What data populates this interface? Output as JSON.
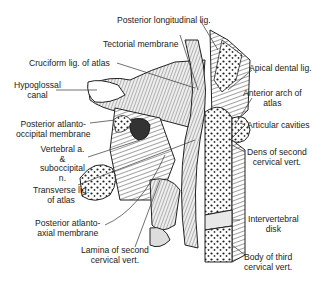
{
  "figure": {
    "labels": {
      "posterior_longitudinal_lig": "Posterior longitudinal lig.",
      "tectorial_membrane": "Tectorial membrane",
      "cruciform_lig": "Cruciform lig. of atlas",
      "hypoglossal_canal_1": "Hypoglossal",
      "hypoglossal_canal_2": "canal",
      "apical_dental_lig": "Apical dental lig.",
      "anterior_arch_1": "Anterior arch of",
      "anterior_arch_2": "atlas",
      "post_atlanto_occipital_1": "Posterior atlanto-",
      "post_atlanto_occipital_2": "occipital membrane",
      "articular_cavities": "Articular cavities",
      "vertebral_a_1": "Vertebral a.",
      "vertebral_a_2": "&",
      "vertebral_a_3": "suboccipital",
      "vertebral_a_4": "n.",
      "dens_1": "Dens of second",
      "dens_2": "cervical vert.",
      "transverse_lig_1": "Transverse lig.",
      "transverse_lig_2": "of atlas",
      "post_atlanto_axial_1": "Posterior atlanto-",
      "post_atlanto_axial_2": "axial membrane",
      "intervertebral_1": "Intervertebral",
      "intervertebral_2": "disk",
      "lamina_1": "Lamina of second",
      "lamina_2": "cervical vert.",
      "body_third_1": "Body of third",
      "body_third_2": "cervical vert."
    }
  }
}
